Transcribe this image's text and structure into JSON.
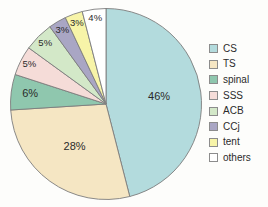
{
  "chart_data": {
    "type": "pie",
    "title": "",
    "subtitle": "",
    "xlabel": "",
    "ylabel": "",
    "legend_position": "right",
    "grid": false,
    "start_angle_deg": 0,
    "direction": "clockwise",
    "categories": [
      "CS",
      "TS",
      "spinal",
      "SSS",
      "ACB",
      "CCj",
      "tent",
      "others"
    ],
    "values": [
      46,
      28,
      6,
      5,
      5,
      3,
      3,
      4
    ],
    "value_unit": "%",
    "data_labels": [
      "46%",
      "28%",
      "6%",
      "5%",
      "5%",
      "3%",
      "3%",
      "4%"
    ],
    "colors": [
      "#b3dbdd",
      "#f5e6c3",
      "#8fc7ae",
      "#f5dcd8",
      "#d3e8c8",
      "#a9a6c4",
      "#f7f4a8",
      "#ffffff"
    ],
    "slices": [
      {
        "label": "CS",
        "value": 46,
        "data_label": "46%",
        "color": "#b3dbdd"
      },
      {
        "label": "TS",
        "value": 28,
        "data_label": "28%",
        "color": "#f5e6c3"
      },
      {
        "label": "spinal",
        "value": 6,
        "data_label": "6%",
        "color": "#8fc7ae"
      },
      {
        "label": "SSS",
        "value": 5,
        "data_label": "5%",
        "color": "#f5dcd8"
      },
      {
        "label": "ACB",
        "value": 5,
        "data_label": "5%",
        "color": "#d3e8c8"
      },
      {
        "label": "CCj",
        "value": 3,
        "data_label": "3%",
        "color": "#a9a6c4"
      },
      {
        "label": "tent",
        "value": 3,
        "data_label": "3%",
        "color": "#f7f4a8"
      },
      {
        "label": "others",
        "value": 4,
        "data_label": "4%",
        "color": "#ffffff"
      }
    ]
  },
  "legend": {
    "items": [
      {
        "label": "CS",
        "color": "#b3dbdd"
      },
      {
        "label": "TS",
        "color": "#f5e6c3"
      },
      {
        "label": "spinal",
        "color": "#8fc7ae"
      },
      {
        "label": "SSS",
        "color": "#f5dcd8"
      },
      {
        "label": "ACB",
        "color": "#d3e8c8"
      },
      {
        "label": "CCj",
        "color": "#a9a6c4"
      },
      {
        "label": "tent",
        "color": "#f7f4a8"
      },
      {
        "label": "others",
        "color": "#ffffff"
      }
    ]
  },
  "style": {
    "background": "#fdfdfb",
    "slice_stroke": "#7d7d7d",
    "label_color": "#2a2a2a"
  }
}
